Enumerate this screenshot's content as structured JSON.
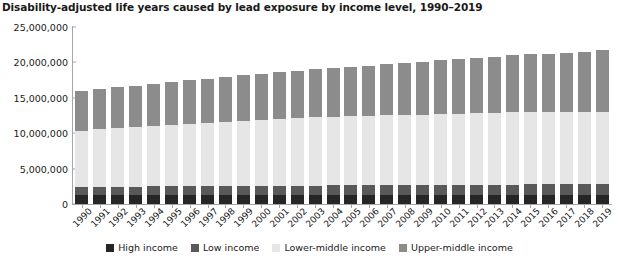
{
  "chart_data": {
    "type": "bar",
    "stacked": true,
    "title": "Disability-adjusted life years caused by lead exposure by income level, 1990–2019",
    "xlabel": "",
    "ylabel": "",
    "ylim": [
      0,
      25000000
    ],
    "yticks": [
      0,
      5000000,
      10000000,
      15000000,
      20000000,
      25000000
    ],
    "ytick_labels": [
      "0",
      "5,000,000",
      "10,000,000",
      "15,000,000",
      "20,000,000",
      "25,000,000"
    ],
    "grid": false,
    "legend_position": "bottom",
    "categories": [
      "1990",
      "1991",
      "1992",
      "1993",
      "1994",
      "1995",
      "1996",
      "1997",
      "1998",
      "1999",
      "2000",
      "2001",
      "2002",
      "2003",
      "2004",
      "2005",
      "2006",
      "2007",
      "2008",
      "2009",
      "2010",
      "2011",
      "2012",
      "2013",
      "2014",
      "2015",
      "2016",
      "2017",
      "2018",
      "2019"
    ],
    "series": [
      {
        "name": "High income",
        "color": "#262626",
        "values": [
          1300000,
          1290000,
          1290000,
          1280000,
          1280000,
          1280000,
          1280000,
          1280000,
          1280000,
          1280000,
          1290000,
          1290000,
          1290000,
          1290000,
          1290000,
          1290000,
          1290000,
          1300000,
          1300000,
          1300000,
          1300000,
          1310000,
          1310000,
          1310000,
          1320000,
          1320000,
          1320000,
          1330000,
          1330000,
          1330000
        ]
      },
      {
        "name": "Low income",
        "color": "#595959",
        "values": [
          1150000,
          1160000,
          1180000,
          1190000,
          1210000,
          1220000,
          1240000,
          1250000,
          1270000,
          1280000,
          1290000,
          1300000,
          1310000,
          1320000,
          1330000,
          1340000,
          1350000,
          1360000,
          1370000,
          1380000,
          1390000,
          1400000,
          1410000,
          1420000,
          1430000,
          1440000,
          1440000,
          1450000,
          1450000,
          1450000
        ]
      },
      {
        "name": "Lower-middle income",
        "color": "#e6e6e6",
        "values": [
          7900000,
          8100000,
          8250000,
          8400000,
          8550000,
          8700000,
          8850000,
          8980000,
          9100000,
          9230000,
          9350000,
          9450000,
          9550000,
          9650000,
          9700000,
          9750000,
          9800000,
          9850000,
          9900000,
          9950000,
          10000000,
          10050000,
          10100000,
          10150000,
          10200000,
          10220000,
          10240000,
          10250000,
          10260000,
          10260000
        ]
      },
      {
        "name": "Upper-middle income",
        "color": "#8c8c8c",
        "values": [
          5650000,
          5700000,
          5750000,
          5800000,
          5900000,
          6000000,
          6100000,
          6200000,
          6300000,
          6400000,
          6500000,
          6600000,
          6700000,
          6800000,
          6900000,
          7000000,
          7100000,
          7200000,
          7350000,
          7500000,
          7650000,
          7750000,
          7850000,
          7950000,
          8050000,
          8150000,
          8250000,
          8350000,
          8450000,
          8760000
        ]
      }
    ],
    "totals": [
      16000000,
      16250000,
      16470000,
      16670000,
      16940000,
      17200000,
      17470000,
      17710000,
      17950000,
      18190000,
      18430000,
      18640000,
      18850000,
      19060000,
      19220000,
      19380000,
      19540000,
      19710000,
      19920000,
      20130000,
      20340000,
      20510000,
      20670000,
      20830000,
      21000000,
      21130000,
      21250000,
      21380000,
      21490000,
      21800000
    ]
  },
  "legend": {
    "items": [
      {
        "label": "High income",
        "color": "#262626"
      },
      {
        "label": "Low income",
        "color": "#595959"
      },
      {
        "label": "Lower-middle income",
        "color": "#e6e6e6"
      },
      {
        "label": "Upper-middle income",
        "color": "#8c8c8c"
      }
    ]
  }
}
